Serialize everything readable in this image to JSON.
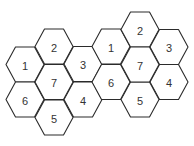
{
  "diagram": {
    "title": "",
    "hex_radius": 19,
    "hex_half_height": 17.5,
    "stroke_color": "#2b2b2b",
    "label_color": "#333333",
    "clusters": [
      {
        "name": "left-cluster",
        "cells": [
          {
            "label": "1",
            "cx": 25,
            "cy": 64.5
          },
          {
            "label": "2",
            "cx": 54,
            "cy": 46.5
          },
          {
            "label": "3",
            "cx": 83,
            "cy": 64
          },
          {
            "label": "4",
            "cx": 83,
            "cy": 99.5
          },
          {
            "label": "5",
            "cx": 54,
            "cy": 117.5
          },
          {
            "label": "6",
            "cx": 25,
            "cy": 99.5
          },
          {
            "label": "7",
            "cx": 54,
            "cy": 82
          }
        ]
      },
      {
        "name": "right-cluster",
        "cells": [
          {
            "label": "1",
            "cx": 111,
            "cy": 46.5
          },
          {
            "label": "2",
            "cx": 140,
            "cy": 29.5
          },
          {
            "label": "3",
            "cx": 169,
            "cy": 47
          },
          {
            "label": "4",
            "cx": 169,
            "cy": 82
          },
          {
            "label": "5",
            "cx": 140,
            "cy": 99.5
          },
          {
            "label": "6",
            "cx": 111,
            "cy": 82
          },
          {
            "label": "7",
            "cx": 140,
            "cy": 64.5
          }
        ]
      }
    ]
  }
}
